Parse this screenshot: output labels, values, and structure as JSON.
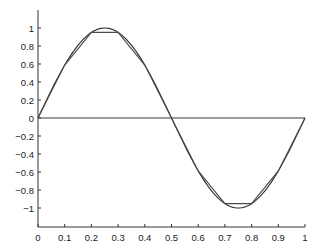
{
  "chart_data": {
    "type": "line",
    "title": "",
    "xlabel": "",
    "ylabel": "",
    "xlim": [
      0,
      1
    ],
    "ylim": [
      -1.1,
      1.1
    ],
    "grid": false,
    "legend": null,
    "x_ticks": [
      0,
      0.1,
      0.2,
      0.3,
      0.4,
      0.5,
      0.6,
      0.7,
      0.8,
      0.9,
      1
    ],
    "x_tick_labels": [
      "0",
      "0.1",
      "0.2",
      "0.3",
      "0.4",
      "0.5",
      "0.6",
      "0.7",
      "0.8",
      "0.9",
      "1"
    ],
    "y_ticks": [
      1,
      0.8,
      0.6,
      0.4,
      0.2,
      0,
      -0.2,
      -0.4,
      -0.6,
      -0.8,
      -1
    ],
    "y_tick_labels": [
      "1",
      "0.8",
      "0.6",
      "0.4",
      "0.2",
      "0",
      "−0.2",
      "−0.4",
      "−0.6",
      "−0.8",
      "−1"
    ],
    "series": [
      {
        "name": "sin(2πx) smooth",
        "style": "smooth",
        "function": "sin(2*pi*x)",
        "x_range": [
          0,
          1
        ]
      },
      {
        "name": "piecewise linear approximation",
        "style": "linear",
        "x": [
          0,
          0.1,
          0.2,
          0.3,
          0.4,
          0.5,
          0.6,
          0.7,
          0.8,
          0.9,
          1.0
        ],
        "values": [
          0,
          0.588,
          0.951,
          0.951,
          0.588,
          0,
          -0.588,
          -0.951,
          -0.951,
          -0.588,
          0
        ]
      },
      {
        "name": "zero line",
        "style": "flat",
        "x": [
          0,
          1
        ],
        "values": [
          0,
          0
        ]
      }
    ]
  },
  "colors": {
    "axis": "#333333",
    "smooth": "#2a2a2a",
    "linear": "#4a4a4a",
    "zero": "#3a3a3a"
  }
}
